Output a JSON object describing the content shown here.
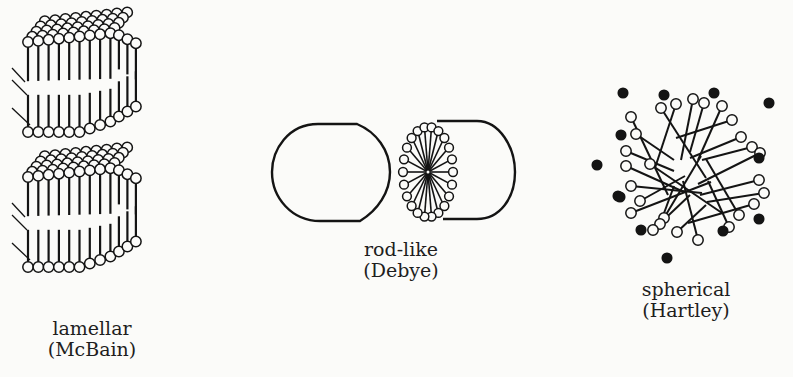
{
  "figure": {
    "models": [
      {
        "id": "lamellar",
        "name": "lamellar",
        "author": "(McBain)",
        "label_x": 92,
        "label_y": 318
      },
      {
        "id": "rod-like",
        "name": "rod-like",
        "author": "(Debye)",
        "label_x": 401,
        "label_y": 239
      },
      {
        "id": "spherical",
        "name": "spherical",
        "author": "(Hartley)",
        "label_x": 686,
        "label_y": 279
      }
    ]
  },
  "colors": {
    "ink": "#141414",
    "paper": "#fbfbf9"
  }
}
